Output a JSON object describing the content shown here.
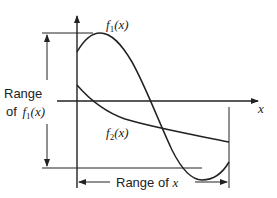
{
  "diagram": {
    "title": "",
    "labels": {
      "f1": {
        "name": "f",
        "sub": "1",
        "arg": "(x)"
      },
      "f2": {
        "name": "f",
        "sub": "2",
        "arg": "(x)"
      },
      "x_axis": "x",
      "range_f1_line1": "Range",
      "range_f1_line2_prefix": "of ",
      "range_f1_fn": "f",
      "range_f1_sub": "1",
      "range_f1_arg": "(x)",
      "range_x_prefix": "Range of ",
      "range_x_var": "x"
    },
    "colors": {
      "line": "#222222",
      "background": "#ffffff"
    }
  }
}
